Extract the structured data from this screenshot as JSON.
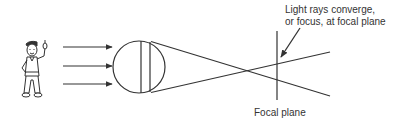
{
  "diagram": {
    "callout": {
      "line1": "Light rays converge,",
      "line2": "or focus, at focal plane"
    },
    "focal_plane_label": "Focal plane",
    "elements": {
      "observer": "cartoon-person-pointing",
      "incoming_rays": 3,
      "lens": "circle-lens"
    },
    "colors": {
      "stroke": "#333333",
      "background": "#ffffff"
    }
  }
}
